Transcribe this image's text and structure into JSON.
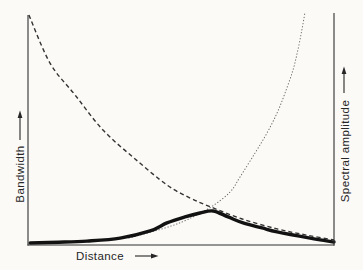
{
  "labels": {
    "x": "Distance",
    "y_left": "Bandwidth",
    "y_right": "Spectral amplitude"
  },
  "chart_data": {
    "type": "line",
    "title": "",
    "xlabel": "Distance",
    "ylabel_left": "Bandwidth",
    "ylabel_right": "Spectral amplitude",
    "x_range": [
      0,
      1
    ],
    "y_range": [
      0,
      1
    ],
    "grid": false,
    "legend": false,
    "ticks": false,
    "series": [
      {
        "name": "Bandwidth vs distance",
        "style": "dashed",
        "axis": "left",
        "x": [
          0.003,
          0.072,
          0.154,
          0.245,
          0.35,
          0.454,
          0.53,
          0.598,
          0.7,
          0.814,
          0.91,
          1.0
        ],
        "y": [
          1.0,
          0.791,
          0.652,
          0.5,
          0.374,
          0.261,
          0.204,
          0.165,
          0.113,
          0.07,
          0.043,
          0.022
        ]
      },
      {
        "name": "Spectral amplitude vs distance",
        "style": "dotted",
        "axis": "right",
        "x": [
          0.33,
          0.45,
          0.52,
          0.598,
          0.66,
          0.693,
          0.742,
          0.781,
          0.814,
          0.84,
          0.866,
          0.882,
          0.895,
          0.905
        ],
        "y": [
          0.03,
          0.075,
          0.11,
          0.165,
          0.23,
          0.296,
          0.4,
          0.487,
          0.574,
          0.661,
          0.761,
          0.848,
          0.935,
          1.01
        ]
      },
      {
        "name": "Unlabeled thick solid curve (peaks at crossing of dashed and dotted)",
        "style": "solid-thick",
        "axis": "left",
        "x": [
          0.007,
          0.1,
          0.193,
          0.301,
          0.399,
          0.454,
          0.513,
          0.562,
          0.605,
          0.654,
          0.703,
          0.765,
          0.814,
          0.922,
          1.0
        ],
        "y": [
          0.009,
          0.012,
          0.017,
          0.03,
          0.061,
          0.096,
          0.122,
          0.139,
          0.148,
          0.122,
          0.096,
          0.074,
          0.057,
          0.03,
          0.013
        ]
      }
    ]
  }
}
